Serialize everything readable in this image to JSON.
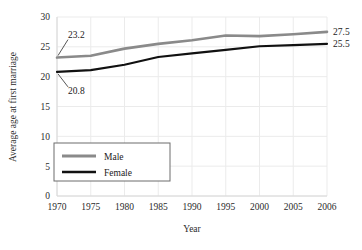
{
  "chart_data": {
    "type": "line",
    "title": "",
    "xlabel": "Year",
    "ylabel": "Average age at first marriage",
    "categories": [
      "1970",
      "1975",
      "1980",
      "1985",
      "1990",
      "1995",
      "2000",
      "2005",
      "2006"
    ],
    "ylim": [
      0,
      30
    ],
    "yticks": [
      "0",
      "5",
      "10",
      "15",
      "20",
      "25",
      "30"
    ],
    "ytick_values": [
      0,
      5,
      10,
      15,
      20,
      25,
      30
    ],
    "grid": true,
    "legend_position": "lower-left",
    "series": [
      {
        "name": "Male",
        "color": "#8a8a8a",
        "values": [
          23.2,
          23.5,
          24.7,
          25.5,
          26.1,
          26.9,
          26.8,
          27.1,
          27.5
        ]
      },
      {
        "name": "Female",
        "color": "#111111",
        "values": [
          20.8,
          21.1,
          22.0,
          23.3,
          23.9,
          24.5,
          25.1,
          25.3,
          25.5
        ]
      }
    ],
    "annotations": [
      {
        "name": "male-start-label",
        "text": "23.2",
        "value": 23.2,
        "series": "Male",
        "category": "1970",
        "side": "left"
      },
      {
        "name": "female-start-label",
        "text": "20.8",
        "value": 20.8,
        "series": "Female",
        "category": "1970",
        "side": "left"
      },
      {
        "name": "male-end-label",
        "text": "27.5",
        "value": 27.5,
        "series": "Male",
        "category": "2006",
        "side": "right"
      },
      {
        "name": "female-end-label",
        "text": "25.5",
        "value": 25.5,
        "series": "Female",
        "category": "2006",
        "side": "right"
      }
    ],
    "legend": [
      {
        "label": "Male",
        "color": "#8a8a8a"
      },
      {
        "label": "Female",
        "color": "#111111"
      }
    ]
  }
}
